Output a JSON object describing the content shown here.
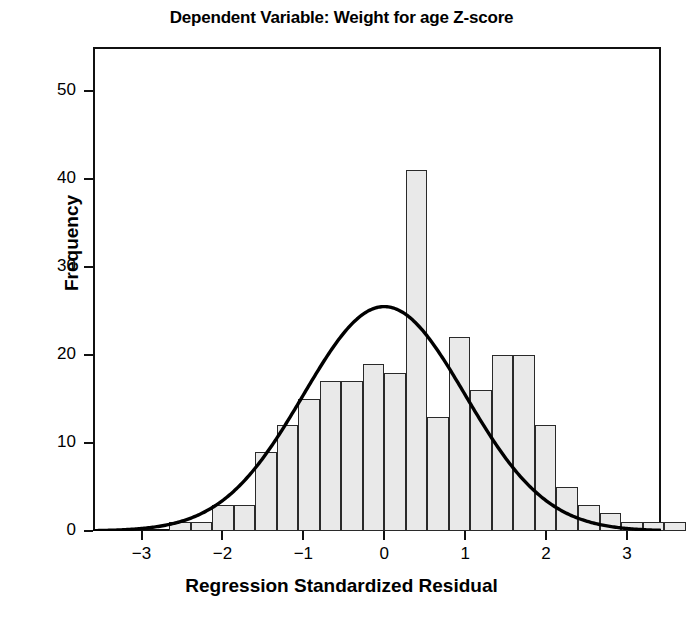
{
  "chart_data": {
    "type": "bar",
    "title": "Dependent Variable: Weight for age Z-score",
    "xlabel": "Regression Standardized Residual",
    "ylabel": "Frequency",
    "xlim": [
      -3.6,
      3.42
    ],
    "ylim": [
      0,
      55
    ],
    "xticks": [
      -3,
      -2,
      -1,
      0,
      1,
      2,
      3
    ],
    "xtick_labels": [
      "−3",
      "−2",
      "−1",
      "0",
      "1",
      "2",
      "3"
    ],
    "yticks": [
      0,
      10,
      20,
      30,
      40,
      50
    ],
    "ytick_labels": [
      "0",
      "10",
      "20",
      "30",
      "40",
      "50"
    ],
    "grid": false,
    "legend": false,
    "bin_width": 0.266,
    "bin_left_edges": [
      -2.66,
      -2.394,
      -2.128,
      -1.862,
      -1.596,
      -1.33,
      -1.064,
      -0.798,
      -0.532,
      -0.266,
      0.0,
      0.266,
      0.532,
      0.798,
      1.064,
      1.33,
      1.596,
      1.862,
      2.128,
      2.394,
      2.66,
      2.926,
      3.192,
      3.458
    ],
    "bin_centers": [
      -2.79,
      -2.53,
      -2.26,
      -2.0,
      -1.73,
      -1.46,
      -1.2,
      -0.93,
      -0.67,
      -0.4,
      -0.13,
      0.13,
      0.4,
      0.67,
      0.93,
      1.2,
      1.46,
      1.73,
      2.0,
      2.26,
      2.53,
      2.79,
      3.06,
      3.32
    ],
    "values": [
      1,
      1,
      3,
      3,
      9,
      12,
      15,
      17,
      17,
      19,
      18,
      41,
      13,
      22,
      16,
      20,
      20,
      12,
      5,
      3,
      2,
      1,
      1,
      1
    ],
    "bar_facecolor": "#e9e9e9",
    "bar_edgecolor": "#2a2a2a",
    "overlay": {
      "type": "normal-curve",
      "label": "Normal distribution curve",
      "mean": 0.0,
      "std": 1.0,
      "peak_frequency": 25.5,
      "color": "#000000"
    }
  },
  "axes": {
    "frame_color": "#111111",
    "background": "#ffffff"
  }
}
